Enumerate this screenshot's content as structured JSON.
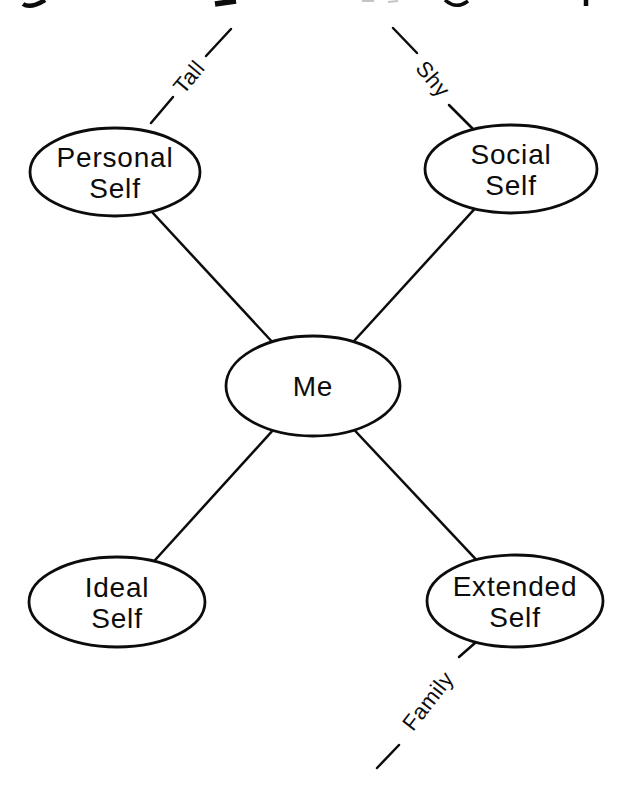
{
  "diagram": {
    "type": "concept-map",
    "background": "#ffffff",
    "stroke_color": "#0c0c0c",
    "node_fill": "#ffffff",
    "center_node": {
      "id": "me",
      "label": "Me"
    },
    "nodes": [
      {
        "id": "personal-self",
        "line1": "Personal",
        "line2": "Self"
      },
      {
        "id": "social-self",
        "line1": "Social",
        "line2": "Self"
      },
      {
        "id": "ideal-self",
        "line1": "Ideal",
        "line2": "Self"
      },
      {
        "id": "extended-self",
        "line1": "Extended",
        "line2": "Self"
      }
    ],
    "annotations": [
      {
        "id": "tall",
        "label": "Tall",
        "attached_to": "personal-self"
      },
      {
        "id": "shy",
        "label": "Shy",
        "attached_to": "social-self"
      },
      {
        "id": "family",
        "label": "Family",
        "attached_to": "extended-self"
      }
    ]
  }
}
